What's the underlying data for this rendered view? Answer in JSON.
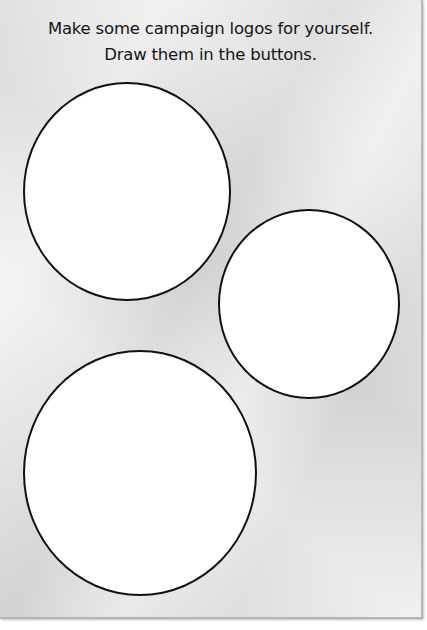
{
  "worksheet": {
    "instructions": {
      "line1": "Make some campaign logos for yourself.",
      "line2": "Draw them in the buttons."
    },
    "buttons": [
      {
        "id": "button-1",
        "shape": "circle",
        "fill": "#ffffff",
        "outline": "#111111"
      },
      {
        "id": "button-2",
        "shape": "circle",
        "fill": "#ffffff",
        "outline": "#111111"
      },
      {
        "id": "button-3",
        "shape": "circle",
        "fill": "#ffffff",
        "outline": "#111111"
      }
    ],
    "paper_color": "#e6e6e6"
  }
}
